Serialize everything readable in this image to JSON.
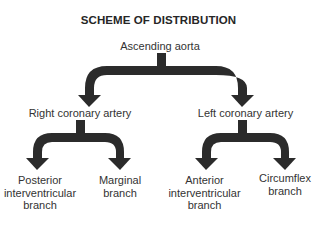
{
  "diagram": {
    "title": "SCHEME OF DISTRIBUTION",
    "arrow_color": "#2b2b2b",
    "root": {
      "label": "Ascending aorta"
    },
    "level1": [
      {
        "label": "Right coronary artery"
      },
      {
        "label": "Left coronary artery"
      }
    ],
    "level2": [
      {
        "parent": "Right coronary artery",
        "lines": [
          "Posterior",
          "interventricular",
          "branch"
        ]
      },
      {
        "parent": "Right coronary artery",
        "lines": [
          "Marginal",
          "branch"
        ]
      },
      {
        "parent": "Left coronary artery",
        "lines": [
          "Anterior",
          "interventricular",
          "branch"
        ]
      },
      {
        "parent": "Left coronary artery",
        "lines": [
          "Circumflex",
          "branch"
        ]
      }
    ]
  }
}
